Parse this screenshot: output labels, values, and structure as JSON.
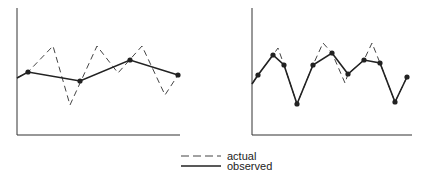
{
  "chart_data": [
    {
      "type": "line",
      "title": "",
      "xlabel": "",
      "ylabel": "",
      "grid": false,
      "legend_position": "bottom-center",
      "description": "Left panel: sparse sampling — observed line connects only a few samples of the actual signal",
      "series": [
        {
          "name": "actual",
          "style": "dashed",
          "points": [
            [
              17,
              78
            ],
            [
              28,
              72
            ],
            [
              53,
              46
            ],
            [
              70,
              105
            ],
            [
              97,
              46
            ],
            [
              118,
              73
            ],
            [
              142,
              46
            ],
            [
              165,
              95
            ],
            [
              178,
              75
            ]
          ]
        },
        {
          "name": "observed",
          "style": "solid",
          "markers": true,
          "points": [
            [
              17,
              78
            ],
            [
              28,
              72
            ],
            [
              80,
              81
            ],
            [
              130,
              60
            ],
            [
              178,
              75
            ]
          ]
        }
      ]
    },
    {
      "type": "line",
      "title": "",
      "xlabel": "",
      "ylabel": "",
      "grid": false,
      "legend_position": "bottom-center",
      "description": "Right panel: dense sampling — observed line closely follows the actual signal",
      "series": [
        {
          "name": "actual",
          "style": "dashed",
          "points": [
            [
              252,
              84
            ],
            [
              258,
              75
            ],
            [
              273,
              55
            ],
            [
              278,
              48
            ],
            [
              284,
              65
            ],
            [
              297,
              104
            ],
            [
              313,
              65
            ],
            [
              323,
              43
            ],
            [
              332,
              53
            ],
            [
              345,
              83
            ],
            [
              348,
              74
            ],
            [
              364,
              60
            ],
            [
              372,
              43
            ],
            [
              380,
              63
            ],
            [
              395,
              102
            ],
            [
              407,
              77
            ]
          ]
        },
        {
          "name": "observed",
          "style": "solid",
          "markers": true,
          "points": [
            [
              252,
              84
            ],
            [
              258,
              75
            ],
            [
              273,
              55
            ],
            [
              284,
              65
            ],
            [
              297,
              104
            ],
            [
              313,
              65
            ],
            [
              332,
              53
            ],
            [
              348,
              74
            ],
            [
              364,
              60
            ],
            [
              380,
              63
            ],
            [
              395,
              102
            ],
            [
              407,
              77
            ]
          ]
        }
      ]
    }
  ],
  "legend": {
    "items": [
      {
        "label": "actual",
        "style": "dashed"
      },
      {
        "label": "observed",
        "style": "solid"
      }
    ]
  },
  "colors": {
    "line": "#222222",
    "axis": "#333333",
    "dashed": "#444444"
  }
}
